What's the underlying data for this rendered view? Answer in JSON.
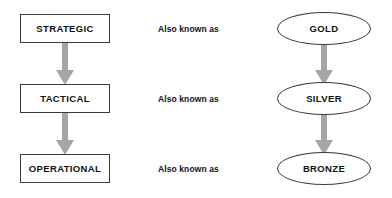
{
  "diagram": {
    "colors": {
      "shape_fill": "#ffffff",
      "shape_border": "#3a3a3a",
      "arrow_fill": "#a6a6a6",
      "text": "#111111",
      "background": "#ffffff"
    },
    "rows": [
      {
        "level_label": "STRATEGIC",
        "connector_label": "Also known as",
        "alias_label": "GOLD"
      },
      {
        "level_label": "TACTICAL",
        "connector_label": "Also known as",
        "alias_label": "SILVER"
      },
      {
        "level_label": "OPERATIONAL",
        "connector_label": "Also known as",
        "alias_label": "BRONZE"
      }
    ],
    "arrows": [
      {
        "name": "strategic-to-tactical",
        "direction": "down"
      },
      {
        "name": "tactical-to-operational",
        "direction": "down"
      },
      {
        "name": "gold-to-silver",
        "direction": "down"
      },
      {
        "name": "silver-to-bronze",
        "direction": "down"
      }
    ]
  }
}
